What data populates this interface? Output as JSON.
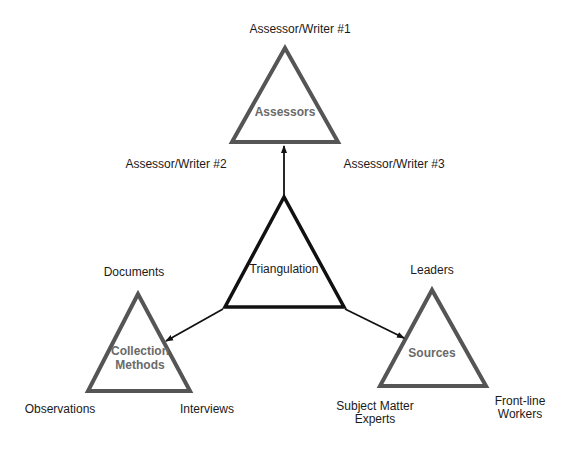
{
  "diagram": {
    "center": {
      "label": "Triangulation"
    },
    "nodes": [
      {
        "id": "assessors",
        "label": "Assessors",
        "corners": {
          "top": "Assessor/Writer #1",
          "bottom_left": "Assessor/Writer #2",
          "bottom_right": "Assessor/Writer #3"
        }
      },
      {
        "id": "collection_methods",
        "label_line1": "Collection",
        "label_line2": "Methods",
        "corners": {
          "top": "Documents",
          "bottom_left": "Observations",
          "bottom_right": "Interviews"
        }
      },
      {
        "id": "sources",
        "label": "Sources",
        "corners": {
          "top": "Leaders",
          "bottom_left_line1": "Subject Matter",
          "bottom_left_line2": "Experts",
          "bottom_right_line1": "Front-line",
          "bottom_right_line2": "Workers"
        }
      }
    ],
    "edges": [
      {
        "from": "Triangulation",
        "to": "Assessors"
      },
      {
        "from": "Triangulation",
        "to": "Collection Methods"
      },
      {
        "from": "Triangulation",
        "to": "Sources"
      }
    ],
    "colors": {
      "outer_triangle_stroke": "#555555",
      "center_triangle_stroke": "#111111",
      "inner_label": "#6a6a6a",
      "text": "#1a1a1a"
    }
  }
}
